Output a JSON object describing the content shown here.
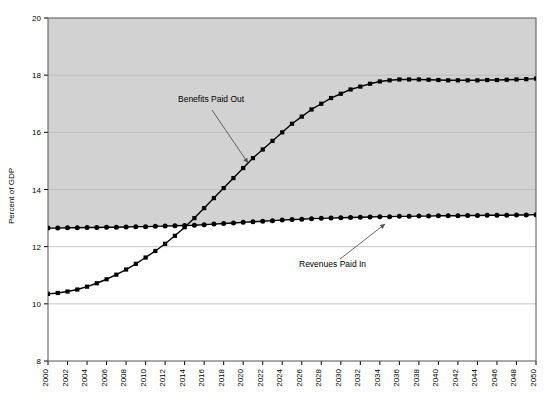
{
  "chart_data": {
    "type": "line",
    "title": "",
    "subtitle": "",
    "xlabel": "",
    "ylabel": "Percent of GDP",
    "xlim": [
      2000,
      2050
    ],
    "ylim": [
      8,
      20
    ],
    "ytick_step": 2,
    "xtick_step": 2,
    "grid": true,
    "legend_position": "none",
    "yticks": [
      "8",
      "10",
      "12",
      "14",
      "16",
      "18",
      "20"
    ],
    "xticks": [
      "2000",
      "2002",
      "2004",
      "2006",
      "2008",
      "2010",
      "2012",
      "2014",
      "2016",
      "2018",
      "2020",
      "2022",
      "2024",
      "2026",
      "2028",
      "2030",
      "2032",
      "2034",
      "2036",
      "2038",
      "2040",
      "2042",
      "2044",
      "2046",
      "2048",
      "2050"
    ],
    "x": [
      2000,
      2001,
      2002,
      2003,
      2004,
      2005,
      2006,
      2007,
      2008,
      2009,
      2010,
      2011,
      2012,
      2013,
      2014,
      2015,
      2016,
      2017,
      2018,
      2019,
      2020,
      2021,
      2022,
      2023,
      2024,
      2025,
      2026,
      2027,
      2028,
      2029,
      2030,
      2031,
      2032,
      2033,
      2034,
      2035,
      2036,
      2037,
      2038,
      2039,
      2040,
      2041,
      2042,
      2043,
      2044,
      2045,
      2046,
      2047,
      2048,
      2049,
      2050
    ],
    "series": [
      {
        "name": "Benefits Paid Out",
        "color": "#000000",
        "marker": "square",
        "values": [
          10.35,
          10.38,
          10.43,
          10.5,
          10.6,
          10.72,
          10.86,
          11.02,
          11.2,
          11.4,
          11.62,
          11.85,
          12.1,
          12.38,
          12.68,
          13.0,
          13.35,
          13.7,
          14.05,
          14.4,
          14.75,
          15.1,
          15.4,
          15.7,
          16.0,
          16.3,
          16.55,
          16.8,
          17.0,
          17.2,
          17.35,
          17.5,
          17.6,
          17.7,
          17.78,
          17.82,
          17.85,
          17.85,
          17.85,
          17.84,
          17.83,
          17.82,
          17.82,
          17.82,
          17.82,
          17.83,
          17.83,
          17.84,
          17.85,
          17.86,
          17.88
        ]
      },
      {
        "name": "Revenues Paid In",
        "color": "#000000",
        "marker": "circle",
        "values": [
          12.65,
          12.65,
          12.66,
          12.66,
          12.67,
          12.67,
          12.68,
          12.68,
          12.69,
          12.7,
          12.7,
          12.71,
          12.72,
          12.73,
          12.74,
          12.75,
          12.77,
          12.79,
          12.81,
          12.83,
          12.85,
          12.87,
          12.89,
          12.91,
          12.93,
          12.95,
          12.96,
          12.98,
          12.99,
          13.0,
          13.01,
          13.02,
          13.03,
          13.04,
          13.05,
          13.05,
          13.06,
          13.06,
          13.07,
          13.07,
          13.08,
          13.08,
          13.08,
          13.09,
          13.09,
          13.1,
          13.1,
          13.1,
          13.11,
          13.11,
          13.12
        ]
      }
    ],
    "annotations": [
      {
        "text": "Benefits Paid Out",
        "text_x": 178,
        "text_y": 102,
        "arrow_from_x": 212,
        "arrow_from_y": 110,
        "arrow_to_x": 248,
        "arrow_to_y": 163
      },
      {
        "text": "Revenues Paid In",
        "text_x": 299,
        "text_y": 267,
        "arrow_from_x": 340,
        "arrow_from_y": 259,
        "arrow_to_x": 385,
        "arrow_to_y": 224
      }
    ],
    "plot_bg_upper": "#d2d2d2",
    "plot_bg_lower": "#ffffff",
    "gridline_color": "#b8b8b8",
    "axis_color": "#000000"
  }
}
